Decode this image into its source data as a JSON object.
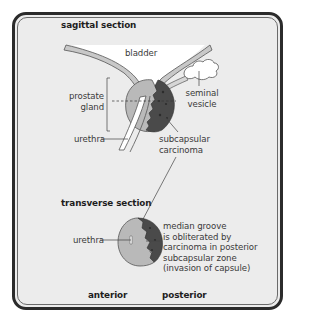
{
  "diagram": {
    "sagittal": {
      "title": "sagittal section",
      "labels": {
        "bladder": "bladder",
        "prostate_line1": "prostate",
        "prostate_line2": "gland",
        "seminal_line1": "seminal",
        "seminal_line2": "vesicle",
        "urethra": "urethra",
        "carcinoma_line1": "subcapsular",
        "carcinoma_line2": "carcinoma"
      }
    },
    "transverse": {
      "title": "transverse section",
      "labels": {
        "urethra": "urethra",
        "note_line1": "median groove",
        "note_line2": "is obliterated by",
        "note_line3": "carcinoma in posterior",
        "note_line4": "subcapsular zone",
        "note_line5": "(invasion of capsule)"
      }
    },
    "orientation": {
      "anterior": "anterior",
      "posterior": "posterior"
    },
    "colors": {
      "panel_bg": "#ececec",
      "frame": "#2b2b2b",
      "gland_light": "#b9b9b9",
      "carcinoma_dark": "#4a4a4a",
      "wall_band": "#c8c8c8",
      "bladder_fill": "#ffffff"
    }
  }
}
